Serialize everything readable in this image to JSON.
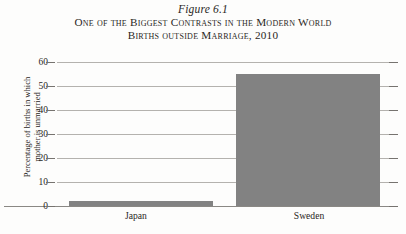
{
  "figure": {
    "number": "Figure 6.1",
    "caption_line_1": "One of the Biggest Contrasts in the Modern World",
    "caption_line_2": "Births outside Marriage, 2010"
  },
  "axis": {
    "y_title_line_1": "Percentage of births in which",
    "y_title_line_2": "mother is unmarried",
    "y_ticks": [
      "0",
      "10",
      "20",
      "30",
      "40",
      "50",
      "60"
    ]
  },
  "colors": {
    "bar_fill": "#828282",
    "gridline": "#b4b2ae",
    "axis_line": "#8a8884",
    "text": "#2a2724",
    "background": "#fdfdfc"
  },
  "chart_data": {
    "type": "bar",
    "title": "One of the Biggest Contrasts in the Modern World",
    "subtitle": "Births outside Marriage, 2010",
    "categories": [
      "Japan",
      "Sweden"
    ],
    "values": [
      2,
      55
    ],
    "series": [
      {
        "name": "Percentage of births in which mother is unmarried",
        "values": [
          2,
          55
        ]
      }
    ],
    "xlabel": "",
    "ylabel": "Percentage of births in which mother is unmarried",
    "ylim": [
      0,
      60
    ],
    "yticks": [
      0,
      10,
      20,
      30,
      40,
      50,
      60
    ],
    "grid": true,
    "legend": false
  }
}
